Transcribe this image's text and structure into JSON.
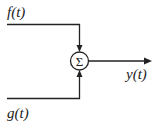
{
  "diagram": {
    "inputs": [
      {
        "label": "f(t)"
      },
      {
        "label": "g(t)"
      }
    ],
    "summer": {
      "symbol": "Σ"
    },
    "output": {
      "label": "y(t)"
    }
  }
}
